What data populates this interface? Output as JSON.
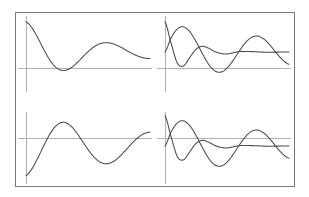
{
  "figure": {
    "background_color": "#ffffff",
    "frame": {
      "name": "outer-frame",
      "x": 15,
      "y": 12,
      "width": 279,
      "height": 174,
      "stroke_color": "#7a7a7a",
      "stroke_width": 1
    },
    "curve_color": "#4a4a4a",
    "axis_color": "#b2b2b2",
    "grid": false,
    "legend": false,
    "tick_labels": false,
    "axis_titles": false
  },
  "chart_data": [
    {
      "id": "top-left",
      "type": "line",
      "title": "",
      "xlabel": "",
      "ylabel": "",
      "xlim": [
        0,
        10
      ],
      "ylim": [
        -1.25,
        1.25
      ],
      "grid": false,
      "legend_position": "none",
      "panel_px": {
        "x": 26,
        "y": 14,
        "width": 124,
        "height": 76
      },
      "axes": {
        "horizontal_axis_y_px": 68,
        "vertical_axis_x_px": 26,
        "vertical_axis_top_px": 16,
        "vertical_axis_bottom_px": 92
      },
      "series": [
        {
          "name": "damped-cosine",
          "formula": "exp(-0.17x)*cos(1.05x)",
          "x": [
            0.0,
            0.5,
            1.0,
            1.5,
            2.0,
            2.5,
            3.0,
            3.5,
            4.0,
            4.5,
            5.0,
            5.5,
            6.0,
            6.5,
            7.0,
            7.5,
            8.0,
            8.5,
            9.0,
            9.5,
            10.0
          ],
          "values": [
            1.0,
            0.784,
            0.428,
            0.031,
            -0.311,
            -0.533,
            -0.609,
            -0.551,
            -0.396,
            -0.194,
            0.009,
            0.174,
            0.276,
            0.307,
            0.272,
            0.188,
            0.077,
            -0.036,
            -0.131,
            -0.193,
            -0.216
          ]
        }
      ]
    },
    {
      "id": "top-right",
      "type": "line",
      "title": "",
      "xlabel": "",
      "ylabel": "",
      "xlim": [
        0,
        10
      ],
      "ylim": [
        -1.25,
        1.25
      ],
      "grid": false,
      "legend_position": "none",
      "panel_px": {
        "x": 165,
        "y": 14,
        "width": 124,
        "height": 76
      },
      "axes": {
        "horizontal_axis_y_px": 68,
        "vertical_axis_x_px": 165,
        "vertical_axis_top_px": 16,
        "vertical_axis_bottom_px": 92
      },
      "series": [
        {
          "name": "steep-decay",
          "formula": "exp(-0.46x)*cos(1.62x)",
          "x": [
            0.0,
            0.5,
            1.0,
            1.5,
            2.0,
            2.5,
            3.0,
            3.5,
            4.0,
            4.5,
            5.0,
            6.0,
            7.0,
            8.0,
            9.0,
            10.0
          ],
          "values": [
            1.0,
            0.276,
            -0.368,
            -0.453,
            -0.179,
            0.091,
            0.187,
            0.127,
            0.018,
            -0.048,
            -0.063,
            0.013,
            0.013,
            -0.005,
            -0.004,
            0.002
          ]
        },
        {
          "name": "damped-sine",
          "formula": "exp(-0.13x)*sin(1.05x)",
          "x": [
            0.0,
            0.5,
            1.0,
            1.5,
            2.0,
            2.5,
            3.0,
            3.5,
            4.0,
            4.5,
            5.0,
            5.5,
            6.0,
            6.5,
            7.0,
            7.5,
            8.0,
            8.5,
            9.0,
            9.5,
            10.0
          ],
          "values": [
            0.0,
            0.468,
            0.762,
            0.827,
            0.669,
            0.349,
            -0.041,
            -0.393,
            -0.617,
            -0.662,
            -0.532,
            -0.274,
            0.035,
            0.312,
            0.487,
            0.522,
            0.418,
            0.21,
            -0.042,
            -0.266,
            -0.405
          ]
        }
      ]
    },
    {
      "id": "bottom-left",
      "type": "line",
      "title": "",
      "xlabel": "",
      "ylabel": "",
      "xlim": [
        0,
        10
      ],
      "ylim": [
        -1.25,
        1.25
      ],
      "grid": false,
      "legend_position": "none",
      "panel_px": {
        "x": 26,
        "y": 108,
        "width": 124,
        "height": 76
      },
      "axes": {
        "horizontal_axis_y_px": 138,
        "vertical_axis_x_px": 26,
        "vertical_axis_top_px": 112,
        "vertical_axis_bottom_px": 184
      },
      "series": [
        {
          "name": "rising-damped-sine",
          "formula": "exp(-0.11x)*sin(0.95x - 1.35)",
          "x": [
            0.0,
            0.5,
            1.0,
            1.5,
            2.0,
            2.5,
            3.0,
            3.5,
            4.0,
            4.5,
            5.0,
            5.5,
            6.0,
            6.5,
            7.0,
            7.5,
            8.0,
            8.5,
            9.0,
            9.5,
            10.0
          ],
          "values": [
            -0.976,
            -0.738,
            -0.355,
            0.067,
            0.441,
            0.694,
            0.78,
            0.697,
            0.481,
            0.189,
            -0.115,
            -0.371,
            -0.535,
            -0.585,
            -0.521,
            -0.365,
            -0.154,
            0.07,
            0.266,
            0.402,
            0.458
          ]
        }
      ]
    },
    {
      "id": "bottom-right",
      "type": "line",
      "title": "",
      "xlabel": "",
      "ylabel": "",
      "xlim": [
        0,
        10
      ],
      "ylim": [
        -1.25,
        1.25
      ],
      "grid": false,
      "legend_position": "none",
      "panel_px": {
        "x": 165,
        "y": 108,
        "width": 124,
        "height": 76
      },
      "axes": {
        "horizontal_axis_y_px": 138,
        "vertical_axis_x_px": 165,
        "vertical_axis_top_px": 112,
        "vertical_axis_bottom_px": 184
      },
      "series": [
        {
          "name": "steep-decay",
          "formula": "exp(-0.44x)*cos(1.58x)",
          "x": [
            0.0,
            0.5,
            1.0,
            1.5,
            2.0,
            2.5,
            3.0,
            3.5,
            4.0,
            4.5,
            5.0,
            6.0,
            7.0,
            8.0,
            9.0,
            10.0
          ],
          "values": [
            1.0,
            0.292,
            -0.352,
            -0.452,
            -0.188,
            0.085,
            0.185,
            0.13,
            0.023,
            -0.045,
            -0.063,
            0.011,
            0.013,
            -0.004,
            -0.004,
            0.002
          ]
        },
        {
          "name": "damped-sine",
          "formula": "exp(-0.13x)*sin(1.05x)",
          "x": [
            0.0,
            0.5,
            1.0,
            1.5,
            2.0,
            2.5,
            3.0,
            3.5,
            4.0,
            4.5,
            5.0,
            5.5,
            6.0,
            6.5,
            7.0,
            7.5,
            8.0,
            8.5,
            9.0,
            9.5,
            10.0
          ],
          "values": [
            0.0,
            0.468,
            0.762,
            0.827,
            0.669,
            0.349,
            -0.041,
            -0.393,
            -0.617,
            -0.662,
            -0.532,
            -0.274,
            0.035,
            0.312,
            0.487,
            0.522,
            0.418,
            0.21,
            -0.042,
            -0.266,
            -0.405
          ]
        }
      ]
    }
  ]
}
